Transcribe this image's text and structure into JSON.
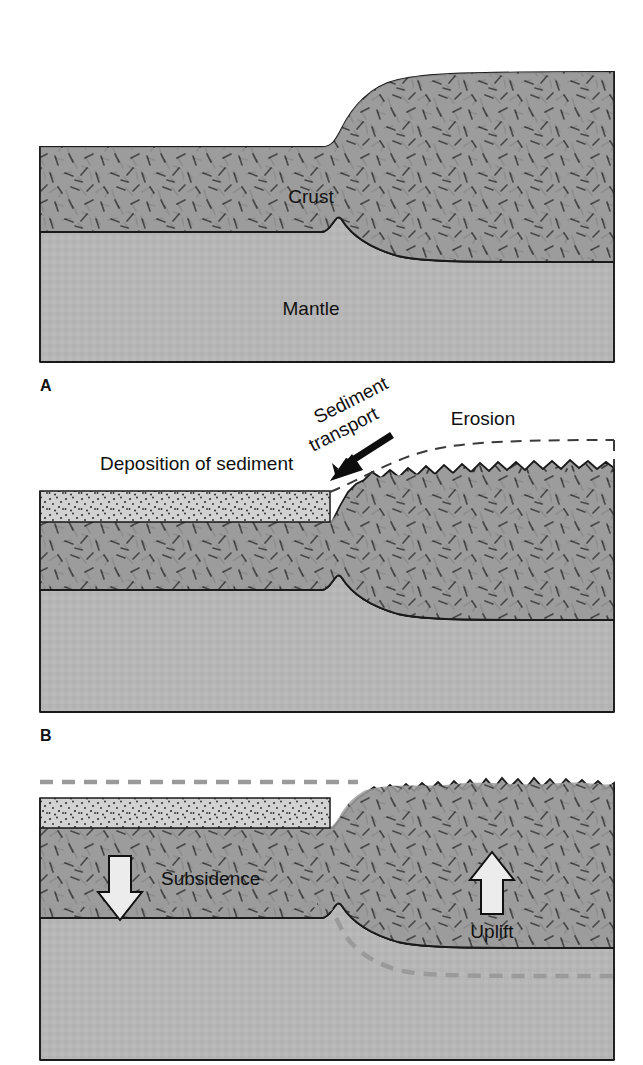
{
  "figure": {
    "title_visible": false,
    "panels": [
      {
        "id": "A",
        "letter": "A",
        "labels": [
          {
            "name": "crust-label",
            "text": "Crust"
          },
          {
            "name": "mantle-label",
            "text": "Mantle"
          }
        ]
      },
      {
        "id": "B",
        "letter": "B",
        "labels": [
          {
            "name": "deposition-label",
            "text": "Deposition of sediment"
          },
          {
            "name": "sediment-transport-label",
            "text": "Sediment"
          },
          {
            "name": "sediment-transport-label-2",
            "text": "transport"
          },
          {
            "name": "erosion-label",
            "text": "Erosion"
          }
        ]
      },
      {
        "id": "C",
        "letter": "",
        "labels": [
          {
            "name": "subsidence-label",
            "text": "Subsidence"
          },
          {
            "name": "uplift-label",
            "text": "Uplift"
          }
        ]
      }
    ]
  },
  "panelA": {
    "letter": "A",
    "crust_label": "Crust",
    "mantle_label": "Mantle"
  },
  "panelB": {
    "letter": "B",
    "deposition_label": "Deposition of sediment",
    "sediment_transport_line1": "Sediment",
    "sediment_transport_line2": "transport",
    "erosion_label": "Erosion"
  },
  "panelC": {
    "subsidence_label": "Subsidence",
    "uplift_label": "Uplift"
  },
  "colors": {
    "crust": "#9c9c9c",
    "mantle": "#b6b6b6",
    "sediment": "#d2d2d2",
    "outline": "#1a1a1a",
    "dashed_reference": "#9a9a9a",
    "arrow_fill": "#e8e8e8",
    "text": "#111111",
    "background": "#ffffff"
  },
  "geometry": {
    "panel_left": 40,
    "panel_right": 614,
    "panelA_top": 70,
    "panelA_bottom": 362,
    "panelB_top": 430,
    "panelB_bottom": 712,
    "panelC_top": 780,
    "panelC_bottom": 1060
  }
}
